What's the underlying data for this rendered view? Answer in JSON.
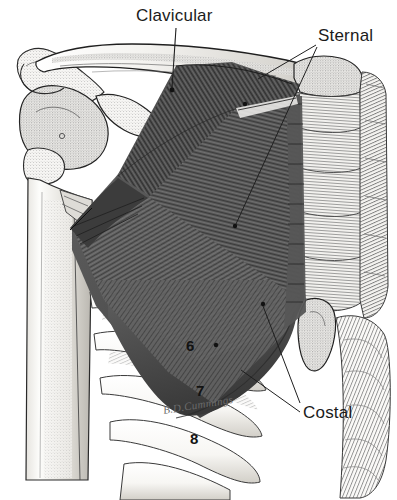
{
  "figure": {
    "view": "anterior",
    "background_color": "#ffffff",
    "width": 397,
    "height": 500
  },
  "labels": [
    {
      "id": "clavicular",
      "text": "Clavicular",
      "x": 136,
      "y": 6,
      "leader": [
        [
          176,
          28
        ],
        [
          172,
          88
        ]
      ],
      "marker": [
        172,
        90
      ]
    },
    {
      "id": "sternal",
      "text": "Sternal",
      "x": 318,
      "y": 26,
      "leader": [
        [
          316,
          45
        ],
        [
          258,
          79
        ]
      ],
      "leader2": [
        [
          316,
          47
        ],
        [
          236,
          224
        ]
      ],
      "marker": [
        245,
        104
      ],
      "marker2": [
        235,
        225
      ]
    },
    {
      "id": "costal",
      "text": "Costal",
      "x": 303,
      "y": 405,
      "leader": [
        [
          300,
          405
        ],
        [
          263,
          306
        ]
      ],
      "leader2": [
        [
          300,
          414
        ],
        [
          243,
          369
        ]
      ],
      "marker": [
        263,
        304
      ]
    }
  ],
  "rib_numbers": [
    {
      "label": "6",
      "x": 186,
      "y": 338
    },
    {
      "label": "7",
      "x": 196,
      "y": 383
    },
    {
      "label": "8",
      "x": 190,
      "y": 431
    }
  ],
  "signature": {
    "text": "B.D.Cummings",
    "x": 163,
    "y": 404
  },
  "colors": {
    "muscle_dark": "#4a4a4a",
    "muscle_mid": "#5e5e5e",
    "muscle_light": "#737373",
    "bone_fill": "#f6f5f3",
    "bone_outline": "#2b2b2b",
    "stipple": "#8d8d8d",
    "label_text": "#1b1b1b",
    "leader_line": "#1f1f1f",
    "signature_text": "#6b6b6b",
    "background": "#ffffff"
  },
  "structures": [
    {
      "id": "clavicle",
      "name": "Clavicle"
    },
    {
      "id": "acromion",
      "name": "Acromion"
    },
    {
      "id": "coracoid-process",
      "name": "Coracoid process"
    },
    {
      "id": "humerus",
      "name": "Humerus"
    },
    {
      "id": "scapula",
      "name": "Scapula"
    },
    {
      "id": "sternum",
      "name": "Sternum"
    },
    {
      "id": "xiphoid-process",
      "name": "Xiphoid process"
    },
    {
      "id": "costal-cartilage",
      "name": "Costal cartilage"
    },
    {
      "id": "ribs",
      "name": "Ribs"
    },
    {
      "id": "pectoralis-clavicular-head",
      "name": "Pectoralis major clavicular head"
    },
    {
      "id": "pectoralis-sternal-head",
      "name": "Pectoralis major sternocostal head"
    },
    {
      "id": "pectoralis-costal-head",
      "name": "Pectoralis major abdominal head"
    },
    {
      "id": "rectus-sheath",
      "name": "Rectus sheath / external oblique"
    }
  ]
}
